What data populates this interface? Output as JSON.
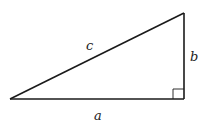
{
  "diagram": {
    "labels": {
      "hypotenuse": "c",
      "vertical_leg": "b",
      "horizontal_leg": "a"
    },
    "stroke_color": "#1a1a1a",
    "background": "#ffffff",
    "vertices": {
      "left": [
        10,
        99
      ],
      "right": [
        184,
        99
      ],
      "top": [
        184,
        13
      ]
    },
    "right_angle_marker": true
  }
}
